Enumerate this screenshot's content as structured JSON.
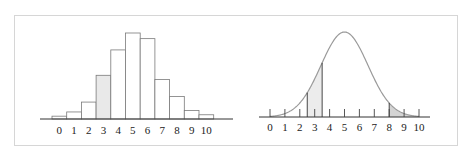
{
  "chart_data": [
    {
      "type": "bar",
      "title": "",
      "xlabel": "",
      "ylabel": "",
      "categories": [
        "0",
        "1",
        "2",
        "3",
        "4",
        "5",
        "6",
        "7",
        "8",
        "9",
        "10"
      ],
      "values": [
        1,
        2.5,
        6,
        15.5,
        24.5,
        30.5,
        28.5,
        14,
        8,
        3,
        1.5
      ],
      "highlighted_category": "3",
      "highlight_color": "#e9e9e9",
      "bar_fill": "#ffffff",
      "bar_stroke": "#555555",
      "grid": false,
      "legend": null
    },
    {
      "type": "area",
      "title": "",
      "xlabel": "",
      "ylabel": "",
      "x_ticks": [
        "0",
        "1",
        "2",
        "3",
        "4",
        "5",
        "6",
        "7",
        "8",
        "9",
        "10"
      ],
      "curve": "normal",
      "mean": 5,
      "std": 1.58,
      "xlim": [
        0,
        10
      ],
      "shaded_regions": [
        {
          "from": 2.5,
          "to": 3.5,
          "color": "#ececec"
        },
        {
          "from": 8,
          "to": 10,
          "color": "#d4d4d4"
        }
      ],
      "curve_color": "#9a9a9a",
      "grid": false,
      "legend": null
    }
  ]
}
